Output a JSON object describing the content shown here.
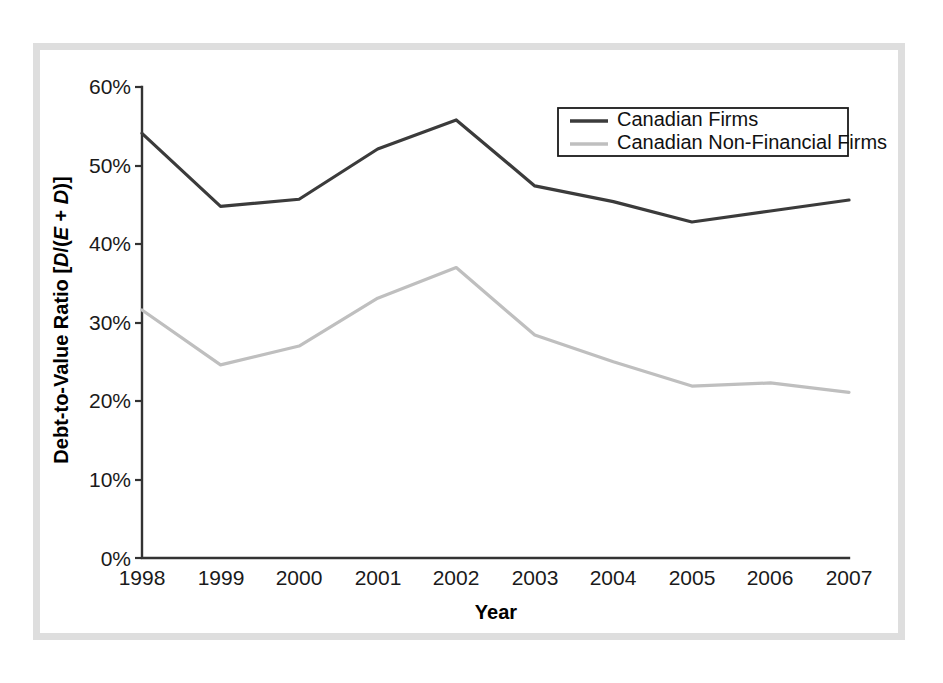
{
  "chart_data": {
    "type": "line",
    "title": "",
    "xlabel": "Year",
    "ylabel_plain": "Debt-to-Value Ratio [D/(E + D)]",
    "ylabel_parts": {
      "prefix": "Debt-to-Value Ratio [",
      "d1": "D",
      "slash": "/(",
      "e": "E",
      "plus": " + ",
      "d2": "D",
      "suffix": ")]"
    },
    "categories": [
      "1998",
      "1999",
      "2000",
      "2001",
      "2002",
      "2003",
      "2004",
      "2005",
      "2006",
      "2007"
    ],
    "x": [
      1998,
      1999,
      2000,
      2001,
      2002,
      2003,
      2004,
      2005,
      2006,
      2007
    ],
    "xlim": [
      1998,
      2007
    ],
    "ylim": [
      0,
      60
    ],
    "ytick_values": [
      0,
      10,
      20,
      30,
      40,
      50,
      60
    ],
    "ytick_labels": [
      "0%",
      "10%",
      "20%",
      "30%",
      "40%",
      "50%",
      "60%"
    ],
    "grid": false,
    "legend_position": "top-right",
    "series": [
      {
        "name": "Canadian Firms",
        "color": "#3b3b3b",
        "values": [
          54.1,
          44.8,
          45.7,
          52.1,
          55.8,
          47.4,
          45.4,
          42.8,
          44.2,
          45.6
        ]
      },
      {
        "name": "Canadian Non-Financial Firms",
        "color": "#bfbfbf",
        "values": [
          31.6,
          24.6,
          27.0,
          33.1,
          37.0,
          28.4,
          25.0,
          21.9,
          22.3,
          21.1
        ]
      }
    ]
  },
  "legend": {
    "entries": [
      {
        "label": "Canadian Firms",
        "color": "#3b3b3b"
      },
      {
        "label": "Canadian Non-Financial Firms",
        "color": "#bfbfbf"
      }
    ]
  },
  "colors": {
    "series_dark": "#3b3b3b",
    "series_light": "#bfbfbf",
    "axis": "#333333",
    "frame": "#dedede",
    "text": "#1a1a1a",
    "background": "#ffffff"
  }
}
